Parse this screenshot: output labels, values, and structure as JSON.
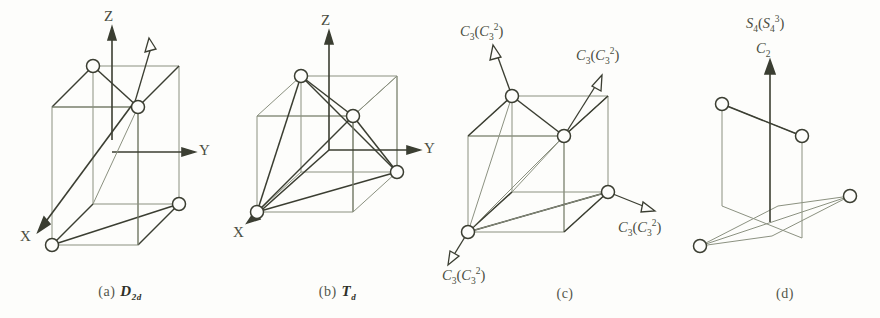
{
  "figure": {
    "background": "#fdfdfb",
    "ink_dark": "#3b3e32",
    "ink_light": "#8b9180",
    "panels": [
      {
        "id": "a",
        "caption_index": "(a)",
        "group_symbol": "D",
        "group_subscript": "2d",
        "axes": [
          "Z",
          "Y",
          "X"
        ],
        "operation_labels": []
      },
      {
        "id": "b",
        "caption_index": "(b)",
        "group_symbol": "T",
        "group_subscript": "d",
        "axes": [
          "Z",
          "Y",
          "X"
        ],
        "operation_labels": []
      },
      {
        "id": "c",
        "caption_index": "(c)",
        "group_symbol": "",
        "group_subscript": "",
        "axes": [],
        "operation_labels": [
          "C3(C3^2)",
          "C3(C3^2)",
          "C3(C3^2)",
          "C3(C3^2)"
        ]
      },
      {
        "id": "d",
        "caption_index": "(d)",
        "group_symbol": "",
        "group_subscript": "",
        "axes": [],
        "operation_labels": [
          "S4(S4^3)",
          "C2"
        ]
      }
    ]
  },
  "panel_a": {
    "caption_index": "(a)",
    "symbol_letter": "D",
    "symbol_sub": "2d",
    "axis_z": "Z",
    "axis_y": "Y",
    "axis_x": "X"
  },
  "panel_b": {
    "caption_index": "(b)",
    "symbol_letter": "T",
    "symbol_sub": "d",
    "axis_z": "Z",
    "axis_y": "Y",
    "axis_x": "X"
  },
  "panel_c": {
    "caption_index": "(c)",
    "op_main": "C",
    "op_sub": "3",
    "op_inner_main": "C",
    "op_inner_sub": "3",
    "op_inner_sup": "2",
    "labels": {
      "top_left": {
        "main": "C",
        "sub": "3",
        "inner_main": "C",
        "inner_sub": "3",
        "inner_sup": "2"
      },
      "top_right": {
        "main": "C",
        "sub": "3",
        "inner_main": "C",
        "inner_sub": "3",
        "inner_sup": "2"
      },
      "bottom_right": {
        "main": "C",
        "sub": "3",
        "inner_main": "C",
        "inner_sub": "3",
        "inner_sup": "2"
      },
      "bottom_left": {
        "main": "C",
        "sub": "3",
        "inner_main": "C",
        "inner_sub": "3",
        "inner_sup": "2"
      }
    }
  },
  "panel_d": {
    "caption_index": "(d)",
    "s4_main": "S",
    "s4_sub": "4",
    "s4_inner_main": "S",
    "s4_inner_sub": "4",
    "s4_inner_sup": "3",
    "c2_main": "C",
    "c2_sub": "2"
  }
}
